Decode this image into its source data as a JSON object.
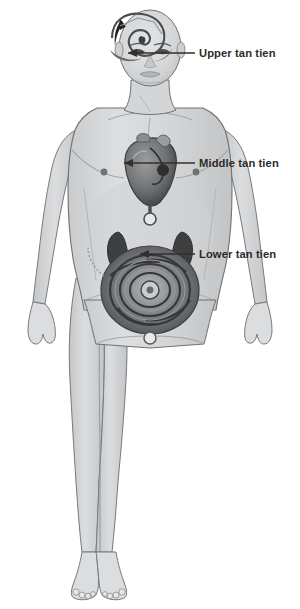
{
  "diagram": {
    "background_color": "#ffffff",
    "figure": {
      "name": "standing-human-body-anterior-view",
      "skin_color": "#d9dadb",
      "skin_shadow_color": "#bfc1c3",
      "outline_color": "#6e7275",
      "hair_color": "#262626"
    },
    "callouts": [
      {
        "id": "upper",
        "label": "Upper tan tien",
        "target": "forehead-third-eye-spiral",
        "text_x": 196,
        "text_y": 54,
        "line_from_x": 195,
        "line_to_x": 122,
        "line_y": 53
      },
      {
        "id": "middle",
        "label": "Middle tan tien",
        "target": "heart-chest-center",
        "text_x": 196,
        "text_y": 164,
        "line_from_x": 195,
        "line_to_x": 118,
        "line_y": 163
      },
      {
        "id": "lower",
        "label": "Lower tan tien",
        "target": "lower-abdomen-intestines-center",
        "text_x": 196,
        "text_y": 255,
        "line_from_x": 195,
        "line_to_x": 134,
        "line_y": 254
      }
    ],
    "anatomy_features": [
      {
        "name": "third-eye-spiral",
        "region": "forehead"
      },
      {
        "name": "heart",
        "region": "chest"
      },
      {
        "name": "kidneys",
        "region": "mid-abdomen"
      },
      {
        "name": "intestines-coil",
        "region": "lower-abdomen"
      },
      {
        "name": "navel",
        "region": "abdomen"
      },
      {
        "name": "nipples",
        "region": "chest"
      }
    ],
    "colors": {
      "label_text": "#2b2b2b",
      "leader_line": "#2f2f2f",
      "organ_dark": "#3a3a3a",
      "organ_mid": "#7c7e80",
      "organ_light": "#a9abad"
    }
  }
}
